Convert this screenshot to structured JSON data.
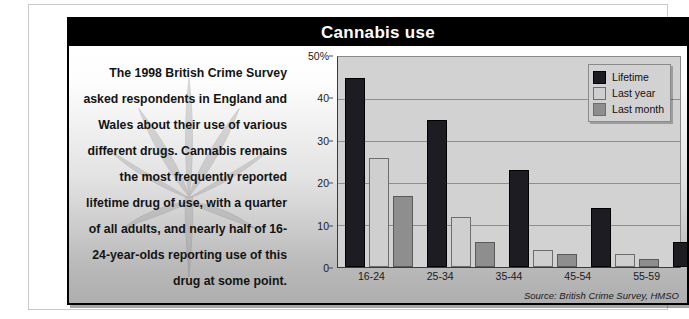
{
  "panel": {
    "title": "Cannabis use"
  },
  "blurb": {
    "paragraph": "The 1998 British Crime Survey asked respondents in England and Wales about their use of various different drugs. Cannabis remains the most frequently reported lifetime drug of use, with a quarter of all adults, and nearly half of 16-24-year-olds reporting use of this drug at some point.",
    "watermark_icon": "cannabis-leaf-icon"
  },
  "source_note": "Source: British Crime Survey, HMSO",
  "colors": {
    "lifetime": "#1c1c22",
    "last_year": "#cfcfcf",
    "last_month": "#8e8e8e",
    "plot_background": "#d2d2d2",
    "title_background": "#000000",
    "gridline": "#8e8e8e"
  },
  "chart_data": {
    "type": "bar",
    "title": "Cannabis use",
    "xlabel": "",
    "ylabel": "",
    "categories": [
      "16-24",
      "25-34",
      "35-44",
      "45-54",
      "55-59"
    ],
    "series": [
      {
        "name": "Lifetime",
        "values": [
          45,
          35,
          23,
          14,
          6
        ]
      },
      {
        "name": "Last year",
        "values": [
          26,
          12,
          4,
          3,
          1
        ]
      },
      {
        "name": "Last month",
        "values": [
          17,
          6,
          3,
          2,
          1
        ]
      }
    ],
    "ylim": [
      0,
      50
    ],
    "yticks": [
      0,
      10,
      20,
      30,
      40,
      50
    ],
    "ytick_labels": [
      "0",
      "10",
      "20",
      "30",
      "40",
      "50%"
    ],
    "grid": true,
    "legend_position": "top-right",
    "annotations": [
      "Source: British Crime Survey, HMSO"
    ]
  }
}
